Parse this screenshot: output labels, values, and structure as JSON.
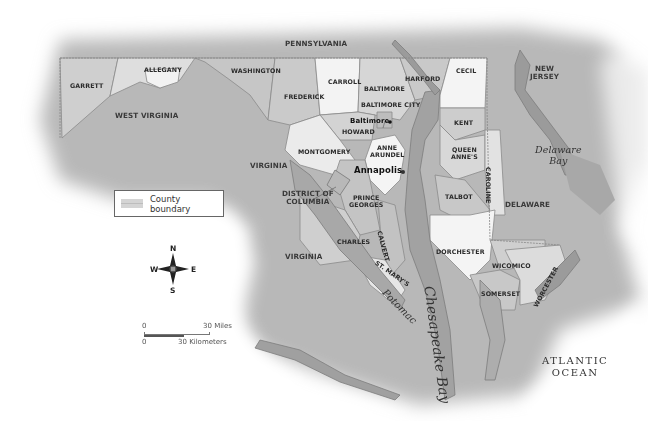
{
  "map": {
    "title": "Maryland counties map",
    "colors": {
      "background": "#ffffff",
      "surrounding_land": "#b5b5b5",
      "county_light": "#f4f4f4",
      "county_mid": "#d2d2d2",
      "county_dark": "#bdbdbd",
      "water": "#9a9a9a",
      "shoreline": "#7a7a7a"
    },
    "states": {
      "pennsylvania": "PENNSYLVANIA",
      "west_virginia": "WEST VIRGINIA",
      "virginia_north": "VIRGINIA",
      "virginia_south": "VIRGINIA",
      "district_of_columbia": "DISTRICT OF\nCOLUMBIA",
      "delaware": "DELAWARE",
      "new_jersey": "NEW\nJERSEY"
    },
    "counties": {
      "garrett": "GARRETT",
      "allegany": "ALLEGANY",
      "washington": "WASHINGTON",
      "frederick": "FREDERICK",
      "carroll": "CARROLL",
      "baltimore": "BALTIMORE",
      "baltimore_city": "BALTIMORE CITY",
      "harford": "HARFORD",
      "cecil": "CECIL",
      "howard": "HOWARD",
      "montgomery": "MONTGOMERY",
      "anne_arundel": "ANNE\nARUNDEL",
      "prince_georges": "PRINCE\nGEORGES",
      "charles": "CHARLES",
      "calvert": "CALVERT",
      "st_marys": "ST. MARY'S",
      "kent": "KENT",
      "queen_annes": "QUEEN\nANNE'S",
      "caroline": "CAROLINE",
      "talbot": "TALBOT",
      "dorchester": "DORCHESTER",
      "wicomico": "WICOMICO",
      "somerset": "SOMERSET",
      "worcester": "WORCESTER"
    },
    "cities": {
      "baltimore": "Baltimore",
      "annapolis": "Annapolis"
    },
    "water": {
      "delaware_bay": "Delaware\nBay",
      "chesapeake_bay": "Chesapeake Bay",
      "potomac": "Potomac",
      "atlantic_ocean": "ATLANTIC\nOCEAN"
    }
  },
  "legend": {
    "county_boundary": "County boundary"
  },
  "compass": {
    "n": "N",
    "s": "S",
    "e": "E",
    "w": "W"
  },
  "scale": {
    "miles_zero": "0",
    "miles_label": "30 Miles",
    "km_zero": "0",
    "km_label": "30 Kilometers"
  }
}
